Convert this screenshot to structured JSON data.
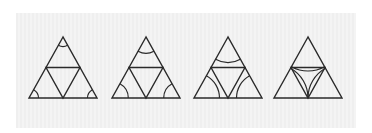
{
  "figure": {
    "background_color": "#f0f0f0",
    "stroke_color": "#2a2a2a",
    "triangles": [
      {
        "apex_x": 63,
        "arc_ratio": 0.28
      },
      {
        "apex_x": 146,
        "arc_ratio": 0.48
      },
      {
        "apex_x": 228,
        "arc_ratio": 0.75
      },
      {
        "apex_x": 308,
        "arc_ratio": 1.0
      }
    ],
    "apex_y": 37,
    "base_y": 98,
    "half_width": 34
  }
}
